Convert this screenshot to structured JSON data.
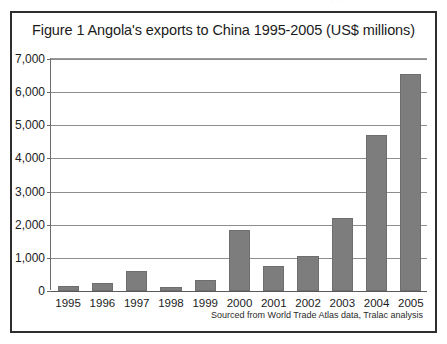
{
  "page_artifact": {
    "text": "·  ·"
  },
  "figure": {
    "title": "Figure 1 Angola's exports to China 1995-2005 (US$ millions)",
    "source_note": "Sourced from World Trade Atlas data, Tralac analysis"
  },
  "colors": {
    "bar_fill": "#7d7d7d",
    "bar_stroke": "#6e6e6e",
    "gridline": "#8d8d8d",
    "frame": "#2e2e2e",
    "text": "#1b1b1b",
    "background": "#ffffff"
  },
  "chart_data": {
    "type": "bar",
    "title": "Figure 1 Angola's exports to China 1995-2005 (US$ millions)",
    "xlabel": "",
    "ylabel": "",
    "categories": [
      "1995",
      "1996",
      "1997",
      "1998",
      "1999",
      "2000",
      "2001",
      "2002",
      "2003",
      "2004",
      "2005"
    ],
    "values": [
      150,
      250,
      600,
      130,
      330,
      1850,
      750,
      1050,
      2200,
      4700,
      6550
    ],
    "ylim": [
      0,
      7000
    ],
    "yticks": [
      0,
      1000,
      2000,
      3000,
      4000,
      5000,
      6000,
      7000
    ],
    "ytick_labels": [
      "0",
      "1,000",
      "2,000",
      "3,000",
      "4,000",
      "5,000",
      "6,000",
      "7,000"
    ],
    "grid": true,
    "legend": false,
    "units": "US$ millions",
    "annotations": [
      "Sourced from World Trade Atlas data, Tralac analysis"
    ]
  }
}
